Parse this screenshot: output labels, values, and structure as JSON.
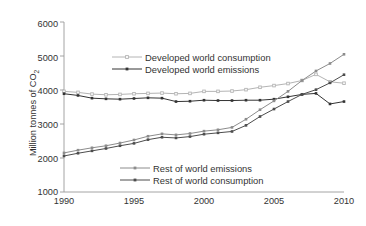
{
  "chart_data": {
    "type": "line",
    "title": "",
    "xlabel": "",
    "ylabel": "Million tonnes of CO",
    "ylabel_sub": "2",
    "xlim": [
      1990,
      2010
    ],
    "ylim": [
      1000,
      6000
    ],
    "xticks": [
      "1990",
      "1995",
      "2000",
      "2005",
      "2010"
    ],
    "yticks": [
      "6000",
      "5000",
      "4000",
      "3000",
      "2000",
      "1000"
    ],
    "grid": false,
    "legend_position": "inside",
    "x": [
      1990,
      1991,
      1992,
      1993,
      1994,
      1995,
      1996,
      1997,
      1998,
      1999,
      2000,
      2001,
      2002,
      2003,
      2004,
      2005,
      2006,
      2007,
      2008,
      2009,
      2010
    ],
    "series": [
      {
        "name": "Developed world consumption",
        "color": "#b4b4b4",
        "marker": "open-square",
        "values": [
          3960,
          3930,
          3880,
          3860,
          3870,
          3890,
          3900,
          3910,
          3890,
          3900,
          3960,
          3960,
          3970,
          4010,
          4080,
          4130,
          4190,
          4280,
          4460,
          4240,
          4200
        ]
      },
      {
        "name": "Developed world emissions",
        "color": "#333333",
        "marker": "filled-square",
        "values": [
          3890,
          3840,
          3760,
          3740,
          3730,
          3750,
          3770,
          3760,
          3660,
          3670,
          3700,
          3690,
          3690,
          3700,
          3700,
          3730,
          3800,
          3870,
          3900,
          3590,
          3660
        ]
      },
      {
        "name": "Rest of world emissions",
        "color": "#8c8c8c",
        "marker": "filled-square",
        "values": [
          2150,
          2230,
          2300,
          2360,
          2440,
          2530,
          2640,
          2710,
          2680,
          2720,
          2790,
          2830,
          2900,
          3140,
          3420,
          3680,
          3960,
          4280,
          4560,
          4780,
          5050
        ]
      },
      {
        "name": "Rest of world consumption",
        "color": "#4d4d4d",
        "marker": "filled-square",
        "values": [
          2060,
          2140,
          2210,
          2280,
          2360,
          2430,
          2540,
          2610,
          2590,
          2630,
          2700,
          2740,
          2780,
          2960,
          3220,
          3440,
          3660,
          3870,
          4010,
          4210,
          4450
        ]
      }
    ],
    "legend_top": [
      {
        "label": "Developed world consumption",
        "color": "#b4b4b4",
        "marker": "open-square"
      },
      {
        "label": "Developed world emissions",
        "color": "#333333",
        "marker": "filled-square"
      }
    ],
    "legend_bottom": [
      {
        "label": "Rest of world emissions",
        "color": "#8c8c8c",
        "marker": "filled-square"
      },
      {
        "label": "Rest of world consumption",
        "color": "#4d4d4d",
        "marker": "filled-square"
      }
    ]
  }
}
